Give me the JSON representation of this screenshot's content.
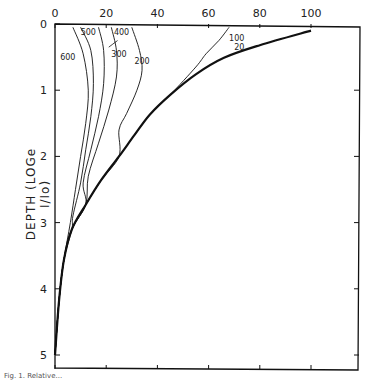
{
  "chart_data": {
    "type": "line",
    "title": "",
    "xlabel": "",
    "ylabel": "DEPTH (LOGe I/Io)",
    "x_ticks": [
      0,
      20,
      40,
      60,
      80,
      100
    ],
    "y_ticks": [
      0,
      1,
      2,
      3,
      4,
      5
    ],
    "xlim": [
      0,
      118
    ],
    "ylim": [
      5.2,
      0
    ],
    "x_axis_position": "top",
    "y_axis_inverted": true,
    "grid": false,
    "legend": "inline curve labels",
    "series": [
      {
        "name": "20",
        "style": "thick",
        "points": [
          [
            100,
            0.1
          ],
          [
            80,
            0.32
          ],
          [
            66,
            0.51
          ],
          [
            55,
            0.76
          ],
          [
            45,
            1.07
          ],
          [
            37,
            1.37
          ],
          [
            31,
            1.68
          ],
          [
            25,
            2.0
          ],
          [
            18,
            2.36
          ],
          [
            12,
            2.73
          ],
          [
            6.6,
            3.1
          ],
          [
            3.5,
            3.56
          ],
          [
            1.6,
            4.17
          ],
          [
            0,
            5.0
          ]
        ]
      },
      {
        "name": "100",
        "style": "thin",
        "points": [
          [
            68,
            0.05
          ],
          [
            64,
            0.25
          ],
          [
            59,
            0.45
          ],
          [
            55,
            0.65
          ]
        ]
      },
      {
        "name": "200",
        "style": "thin",
        "points": [
          [
            30,
            0.05
          ],
          [
            33,
            0.4
          ],
          [
            34,
            0.7
          ],
          [
            32,
            1.0
          ],
          [
            28,
            1.35
          ],
          [
            25,
            1.6
          ]
        ]
      },
      {
        "name": "300",
        "style": "thin",
        "points": [
          [
            22,
            0.05
          ],
          [
            24,
            0.4
          ],
          [
            24,
            0.8
          ],
          [
            21,
            1.3
          ],
          [
            17,
            1.8
          ],
          [
            13,
            2.3
          ]
        ]
      },
      {
        "name": "400",
        "style": "thin",
        "points": [
          [
            17,
            0.05
          ],
          [
            19,
            0.4
          ],
          [
            19,
            0.9
          ],
          [
            17,
            1.4
          ],
          [
            14,
            1.9
          ],
          [
            11,
            2.4
          ]
        ]
      },
      {
        "name": "500",
        "style": "thin",
        "points": [
          [
            10,
            0.05
          ],
          [
            14,
            0.4
          ],
          [
            15,
            0.9
          ],
          [
            14,
            1.4
          ],
          [
            12,
            1.9
          ],
          [
            10,
            2.4
          ],
          [
            7,
            2.9
          ]
        ]
      },
      {
        "name": "600",
        "style": "thin",
        "points": [
          [
            7,
            0.05
          ],
          [
            11,
            0.45
          ],
          [
            13,
            1.0
          ],
          [
            12,
            1.5
          ],
          [
            10,
            2.0
          ],
          [
            8,
            2.5
          ],
          [
            6,
            3.0
          ]
        ]
      }
    ],
    "labels": [
      {
        "text": "600",
        "x": 5,
        "y": 0.55
      },
      {
        "text": "500",
        "x": 13,
        "y": 0.17
      },
      {
        "text": "400",
        "x": 26,
        "y": 0.17
      },
      {
        "text": "300",
        "x": 25,
        "y": 0.5
      },
      {
        "text": "200",
        "x": 34,
        "y": 0.6
      },
      {
        "text": "100",
        "x": 71,
        "y": 0.25
      },
      {
        "text": "20",
        "x": 72,
        "y": 0.4
      }
    ]
  },
  "axes": {
    "ylabel": "DEPTH (LOGe I/Io)",
    "x_tick_labels": [
      "0",
      "20",
      "40",
      "60",
      "80",
      "100"
    ],
    "y_tick_labels": [
      "0",
      "1",
      "2",
      "3",
      "4",
      "5"
    ]
  },
  "caption": "Fig. 1. Relative..."
}
